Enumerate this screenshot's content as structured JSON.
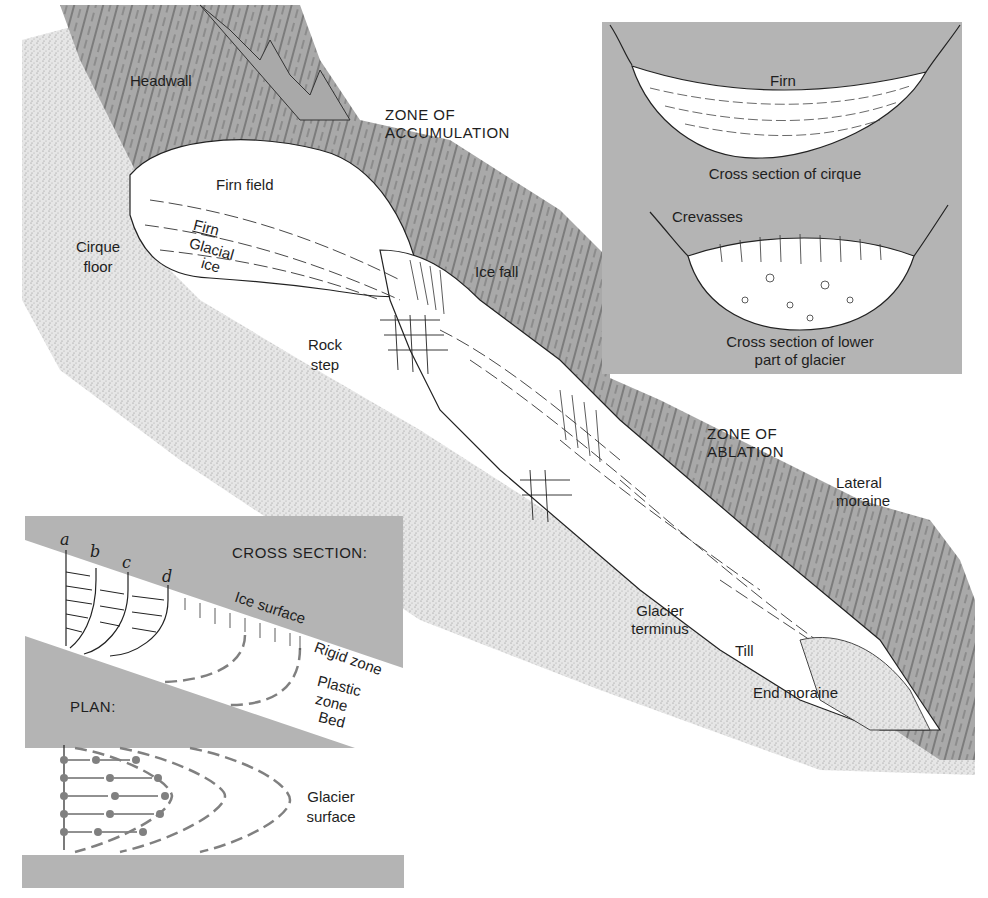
{
  "colors": {
    "rock_gray": "#a9a9a9",
    "panel_gray": "#b4b4b4",
    "ice_white": "#ffffff",
    "ground_stipple": "#d4d4d4",
    "ink": "#1e1e1e",
    "dash_gray": "#808080"
  },
  "main_diagram": {
    "labels": {
      "headwall": "Headwall",
      "zone_accumulation_line1": "ZONE OF",
      "zone_accumulation_line2": "ACCUMULATION",
      "firn_field": "Firn field",
      "firn": "Firn",
      "glacial_ice_line1": "Glacial",
      "glacial_ice_line2": "ice",
      "cirque_floor_line1": "Cirque",
      "cirque_floor_line2": "floor",
      "ice_fall": "Ice fall",
      "rock_step_line1": "Rock",
      "rock_step_line2": "step",
      "zone_ablation_line1": "ZONE OF",
      "zone_ablation_line2": "ABLATION",
      "lateral_moraine_line1": "Lateral",
      "lateral_moraine_line2": "moraine",
      "glacier_terminus_line1": "Glacier",
      "glacier_terminus_line2": "terminus",
      "till": "Till",
      "end_moraine": "End moraine"
    }
  },
  "inset_cross_sections": {
    "firn": "Firn",
    "cirque_caption": "Cross section of cirque",
    "crevasses": "Crevasses",
    "lower_caption_line1": "Cross section of lower",
    "lower_caption_line2": "part of glacier"
  },
  "inset_flow": {
    "cross_section_title": "CROSS SECTION:",
    "profile_letters": [
      "a",
      "b",
      "c",
      "d"
    ],
    "ice_surface": "Ice surface",
    "rigid_zone": "Rigid zone",
    "plastic_zone_line1": "Plastic",
    "plastic_zone_line2": "zone",
    "bed": "Bed",
    "plan_title": "PLAN:",
    "glacier_surface_line1": "Glacier",
    "glacier_surface_line2": "surface"
  }
}
